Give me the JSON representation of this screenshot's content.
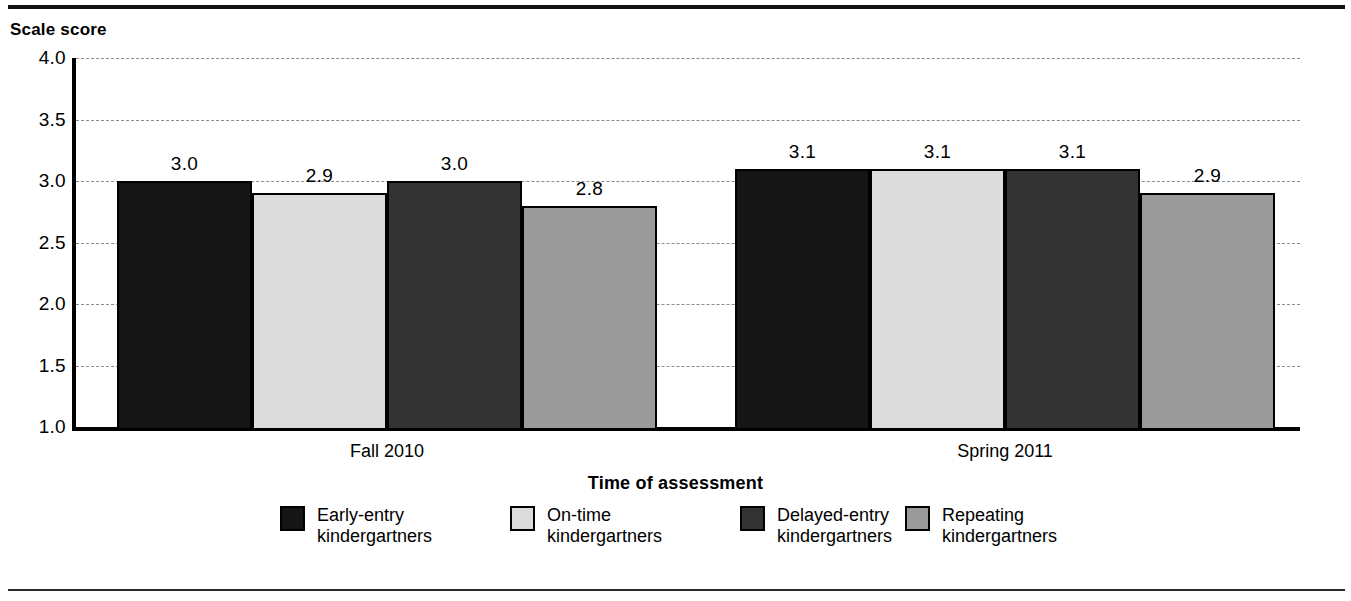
{
  "figure": {
    "y_axis_title": "Scale score",
    "x_axis_title": "Time of assessment"
  },
  "chart_data": {
    "type": "bar",
    "title": "",
    "xlabel": "Time of assessment",
    "ylabel": "Scale score",
    "ylim": [
      1.0,
      4.0
    ],
    "ytick_labels": [
      "4.0",
      "3.5",
      "3.0",
      "2.5",
      "2.0",
      "1.5",
      "1.0"
    ],
    "ytick_values": [
      4.0,
      3.5,
      3.0,
      2.5,
      2.0,
      1.5,
      1.0
    ],
    "grid": true,
    "legend_position": "bottom",
    "categories": [
      "Fall 2010",
      "Spring 2011"
    ],
    "series": [
      {
        "name": "Early-entry kindergartners",
        "legend_line1": "Early-entry",
        "legend_line2": "kindergartners",
        "color": "#151515",
        "values": [
          3.0,
          3.1
        ],
        "labels": [
          "3.0",
          "3.1"
        ]
      },
      {
        "name": "On-time kindergartners",
        "legend_line1": "On-time",
        "legend_line2": "kindergartners",
        "color": "#dcdcdc",
        "values": [
          2.9,
          3.1
        ],
        "labels": [
          "2.9",
          "3.1"
        ]
      },
      {
        "name": "Delayed-entry kindergartners",
        "legend_line1": "Delayed-entry",
        "legend_line2": "kindergartners",
        "color": "#333333",
        "values": [
          3.0,
          3.1
        ],
        "labels": [
          "3.0",
          "3.1"
        ]
      },
      {
        "name": "Repeating kindergartners",
        "legend_line1": "Repeating",
        "legend_line2": "kindergartners",
        "color": "#9a9a9a",
        "values": [
          2.8,
          2.9
        ],
        "labels": [
          "2.8",
          "2.9"
        ]
      }
    ]
  }
}
